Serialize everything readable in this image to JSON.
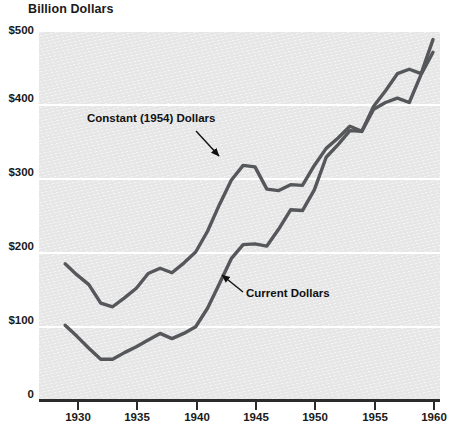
{
  "chart_data": {
    "type": "line",
    "title": "Billion Dollars",
    "xlabel": "",
    "ylabel": "Billion Dollars",
    "xlim": [
      1929,
      1960
    ],
    "ylim": [
      0,
      500
    ],
    "grid": true,
    "gridlines_y": [
      100,
      200,
      300,
      400,
      500
    ],
    "y_ticks": [
      "0",
      "$100",
      "$200",
      "$300",
      "$400",
      "$500"
    ],
    "y_tick_values": [
      0,
      100,
      200,
      300,
      400,
      500
    ],
    "x_ticks": [
      "1930",
      "1935",
      "1940",
      "1945",
      "1950",
      "1955",
      "1960"
    ],
    "x_tick_values": [
      1930,
      1935,
      1940,
      1945,
      1950,
      1955,
      1960
    ],
    "legend_position": "inline-annotations",
    "x": [
      1929,
      1930,
      1931,
      1932,
      1933,
      1934,
      1935,
      1936,
      1937,
      1938,
      1939,
      1940,
      1941,
      1942,
      1943,
      1944,
      1945,
      1946,
      1947,
      1948,
      1949,
      1950,
      1951,
      1952,
      1953,
      1954,
      1955,
      1956,
      1957,
      1958,
      1959,
      1960
    ],
    "series": [
      {
        "name": "Constant (1954) Dollars",
        "color": "#55575a",
        "values": [
          184,
          169,
          156,
          131,
          126,
          138,
          151,
          171,
          178,
          172,
          185,
          200,
          228,
          264,
          297,
          317,
          315,
          285,
          283,
          291,
          290,
          317,
          340,
          354,
          370,
          363,
          393,
          402,
          408,
          402,
          440,
          470
        ]
      },
      {
        "name": "Current Dollars",
        "color": "#55575a",
        "values": [
          101,
          86,
          70,
          55,
          55,
          64,
          72,
          81,
          90,
          83,
          90,
          99,
          124,
          157,
          191,
          210,
          211,
          208,
          231,
          257,
          256,
          284,
          328,
          345,
          364,
          363,
          397,
          418,
          441,
          447,
          441,
          487
        ]
      }
    ],
    "annotations": [
      {
        "text": "Constant (1954) Dollars",
        "target_series": "Constant (1954) Dollars",
        "arrow": "down-right"
      },
      {
        "text": "Current Dollars",
        "target_series": "Current Dollars",
        "arrow": "up-left"
      }
    ],
    "colors": {
      "plot_background": "#e6e6e6",
      "gridline": "#ffffff",
      "axis": "#2b2b2b",
      "line": "#55575a",
      "text": "#1a1a1a"
    }
  },
  "axis": {
    "y_labels": [
      "$500",
      "$400",
      "$300",
      "$200",
      "$100",
      "0"
    ],
    "x_labels": [
      "1930",
      "1935",
      "1940",
      "1945",
      "1950",
      "1955",
      "1960"
    ]
  },
  "annotations": {
    "constant_label": "Constant (1954) Dollars",
    "current_label": "Current Dollars"
  },
  "header": {
    "title": "Billion Dollars"
  }
}
